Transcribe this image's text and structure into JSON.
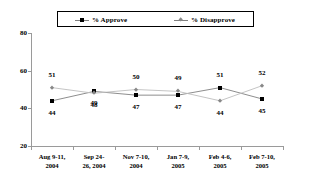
{
  "chart_data": {
    "type": "line",
    "title": "",
    "subtitle": "",
    "xlabel": "",
    "ylabel": "",
    "ylim": [
      20,
      80
    ],
    "yticks": [
      20,
      40,
      60,
      80
    ],
    "grid": false,
    "legend_position": "top",
    "categories": [
      "Aug 9-11, 2004",
      "Sep 24-26, 2004",
      "Nov 7-10, 2004",
      "Jan 7-9, 2005",
      "Feb 4-6, 2005",
      "Feb 7-10, 2005"
    ],
    "category_lines": [
      [
        "Aug 9-11,",
        "2004"
      ],
      [
        "Sep  24-",
        "26, 2004"
      ],
      [
        "Nov 7-10,",
        "2004"
      ],
      [
        "Jan 7-9,",
        "2005"
      ],
      [
        "Feb 4-6,",
        "2005"
      ],
      [
        "Feb 7-10,",
        "2005"
      ]
    ],
    "series": [
      {
        "name": "% Approve",
        "marker": "square",
        "color": "#000000",
        "line_color": "#808080",
        "values": [
          44,
          49,
          47,
          47,
          51,
          45
        ],
        "label_position": [
          "below",
          "below",
          "below",
          "below",
          "above",
          "below"
        ]
      },
      {
        "name": "% Disapprove",
        "marker": "diamond",
        "color": "#888888",
        "line_color": "#bdbdbd",
        "values": [
          51,
          48,
          50,
          49,
          44,
          52
        ],
        "label_position": [
          "above",
          "below",
          "above",
          "above",
          "below",
          "above"
        ]
      }
    ]
  },
  "legend": {
    "items": [
      {
        "label": "% Approve",
        "marker": "square-marker"
      },
      {
        "label": "% Disapprove",
        "marker": "diamond-marker"
      }
    ]
  },
  "axis": {
    "y_tick_labels": [
      "80",
      "60",
      "40",
      "20"
    ]
  }
}
